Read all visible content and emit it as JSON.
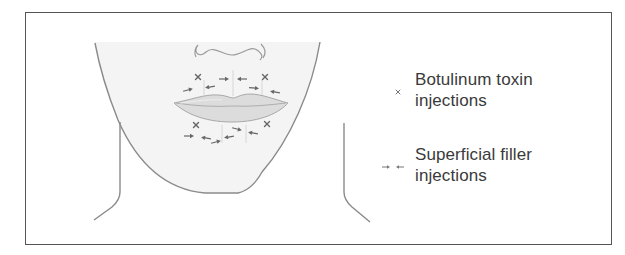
{
  "figure": {
    "colors": {
      "border": "#555555",
      "outline": "#8a8a8a",
      "face_fill": "#f4f4f4",
      "lip_fill": "#dcdcdc",
      "marker": "#666666",
      "text": "#3a3a3a"
    }
  },
  "legend": {
    "items": [
      {
        "icon": "x-mark-icon",
        "symbol": "×",
        "line1": "Botulinum toxin",
        "line2": "injections"
      },
      {
        "icon": "converging-arrows-icon",
        "symbol": "→ ←",
        "line1": "Superficial filler",
        "line2": "injections"
      }
    ]
  },
  "markers": {
    "botulinum_x": [
      {
        "x": 198,
        "y": 77
      },
      {
        "x": 265,
        "y": 77
      },
      {
        "x": 196,
        "y": 125
      },
      {
        "x": 267,
        "y": 124
      }
    ],
    "filler_arrows": [
      {
        "x": 224,
        "y": 79,
        "dir": "right",
        "angle": 0
      },
      {
        "x": 242,
        "y": 79,
        "dir": "left",
        "angle": 0
      },
      {
        "x": 188,
        "y": 90,
        "dir": "right",
        "angle": -15
      },
      {
        "x": 210,
        "y": 87,
        "dir": "left",
        "angle": -10
      },
      {
        "x": 254,
        "y": 88,
        "dir": "right",
        "angle": 5
      },
      {
        "x": 275,
        "y": 92,
        "dir": "left",
        "angle": 10
      },
      {
        "x": 189,
        "y": 136,
        "dir": "right",
        "angle": 0
      },
      {
        "x": 206,
        "y": 138,
        "dir": "left",
        "angle": 10
      },
      {
        "x": 216,
        "y": 142,
        "dir": "right",
        "angle": -15
      },
      {
        "x": 229,
        "y": 137,
        "dir": "left",
        "angle": -10
      },
      {
        "x": 237,
        "y": 129,
        "dir": "right",
        "angle": 15
      },
      {
        "x": 253,
        "y": 133,
        "dir": "left",
        "angle": 10
      }
    ]
  }
}
